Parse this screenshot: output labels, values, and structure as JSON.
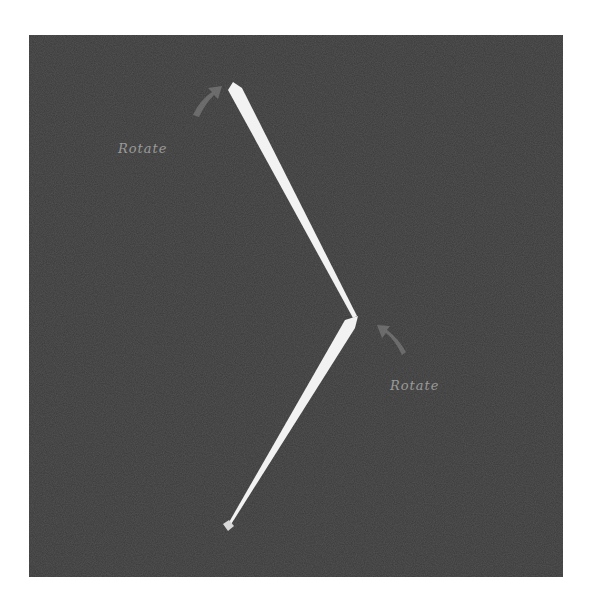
{
  "diagram": {
    "background_color": "#3a3a3a",
    "segment_color": "#f2f2f2",
    "annotation_color": "#8a8a8a",
    "annotations": [
      {
        "id": "rotate-top",
        "label": "Rotate"
      },
      {
        "id": "rotate-joint",
        "label": "Rotate"
      }
    ]
  }
}
